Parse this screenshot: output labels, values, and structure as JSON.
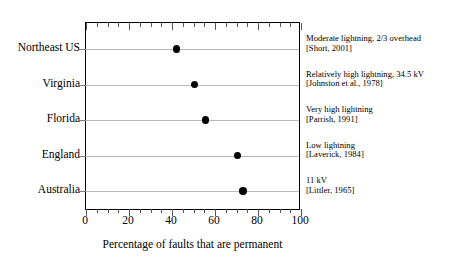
{
  "chart_data": {
    "type": "scatter",
    "title": "",
    "xlabel": "Percentage of faults that are permanent",
    "ylabel": "",
    "xlim": [
      0,
      100
    ],
    "xticks": [
      0,
      20,
      40,
      60,
      80,
      100
    ],
    "xtick_labels": [
      "0",
      "20",
      "40",
      "60",
      "80",
      "100"
    ],
    "minor_tick_step": 5,
    "grid": "horizontal",
    "legend": "none",
    "marker": "filled-circle",
    "marker_color": "#000000",
    "categories": [
      "Northeast US",
      "Virginia",
      "Florida",
      "England",
      "Australia"
    ],
    "values": [
      42,
      50.5,
      55.5,
      70.5,
      73
    ],
    "annotations": [
      {
        "line1": "Moderate lightning, 2/3 overhead",
        "line2": "[Short, 2001]"
      },
      {
        "line1": "Relatively high lightning, 34.5 kV",
        "line2": "[Johnston et al., 1978]"
      },
      {
        "line1": "Very high lightning",
        "line2": "[Parrish, 1991]"
      },
      {
        "line1": "Low lightning",
        "line2": "[Laverick, 1984]"
      },
      {
        "line1": "11 kV",
        "line2": "[Littler, 1965]"
      }
    ]
  }
}
